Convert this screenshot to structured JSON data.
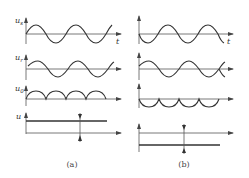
{
  "panels": [
    {
      "id": "a",
      "caption": "(a)",
      "rows": [
        {
          "label": "u",
          "sub": "s",
          "kind": "sine",
          "phase": "rising"
        },
        {
          "label": "u",
          "sub": "r",
          "kind": "sine",
          "phase": "rising"
        },
        {
          "label": "u",
          "sub": "0",
          "kind": "rectified",
          "direction": "above"
        },
        {
          "label": "u",
          "sub": "",
          "kind": "dc",
          "direction": "above"
        }
      ],
      "time_axis_label": "t"
    },
    {
      "id": "b",
      "caption": "(b)",
      "rows": [
        {
          "label": "",
          "sub": "",
          "kind": "sine",
          "phase": "falling"
        },
        {
          "label": "",
          "sub": "",
          "kind": "sine",
          "phase": "rising"
        },
        {
          "label": "",
          "sub": "",
          "kind": "rectified",
          "direction": "below"
        },
        {
          "label": "",
          "sub": "",
          "kind": "dc",
          "direction": "below"
        }
      ],
      "time_axis_label": "t"
    }
  ],
  "colors": {
    "line": "#333333",
    "axis": "#555555",
    "background": "#ffffff"
  }
}
